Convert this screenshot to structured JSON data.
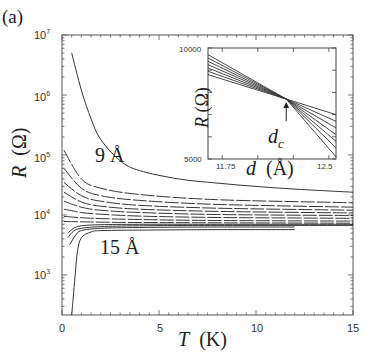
{
  "chart_data": {
    "type": "line",
    "panel_label": "(a)",
    "main": {
      "xlabel_var": "T",
      "xlabel_unit": "(K)",
      "ylabel_var": "R",
      "ylabel_unit": "(Ω)",
      "xlim": [
        0,
        15
      ],
      "ylim_log10": [
        2.3,
        7
      ],
      "yscale": "log",
      "x_ticks": [
        "0",
        "5",
        "10",
        "15"
      ],
      "y_ticks": [
        {
          "base": "10",
          "exp": "7"
        },
        {
          "base": "10",
          "exp": "6"
        },
        {
          "base": "10",
          "exp": "5"
        },
        {
          "base": "10",
          "exp": "4"
        },
        {
          "base": "10",
          "exp": "3"
        }
      ],
      "annotations": [
        {
          "text": "9 Å",
          "x": 2.2,
          "y": 100000
        },
        {
          "text": "15 Å",
          "x": 2.0,
          "y": 3000
        }
      ],
      "series_description": "Family of R(T) curves for film thicknesses from 9 Å (top, insulating) to 15 Å (bottom, superconducting)",
      "series": [
        {
          "name": "9 Å",
          "x": [
            0.5,
            1,
            1.5,
            2,
            3,
            4,
            6,
            8,
            10,
            12,
            15
          ],
          "y": [
            5000000,
            1200000,
            400000,
            180000,
            80000,
            55000,
            40000,
            34000,
            30000,
            27000,
            24000
          ]
        },
        {
          "name": "curve 2",
          "x": [
            0.1,
            1,
            2,
            4,
            8,
            15
          ],
          "y": [
            120000,
            40000,
            28000,
            22000,
            18000,
            16000
          ]
        },
        {
          "name": "curve 3",
          "x": [
            0.1,
            1,
            2,
            4,
            8,
            15
          ],
          "y": [
            60000,
            28000,
            21000,
            17500,
            15000,
            13500
          ]
        },
        {
          "name": "curve 4",
          "x": [
            0.1,
            1,
            2,
            4,
            8,
            15
          ],
          "y": [
            35000,
            21000,
            17000,
            14500,
            13000,
            12000
          ]
        },
        {
          "name": "curve 5",
          "x": [
            0.1,
            1,
            2,
            4,
            8,
            15
          ],
          "y": [
            24000,
            16500,
            14000,
            12500,
            11500,
            10800
          ]
        },
        {
          "name": "curve 6",
          "x": [
            0.1,
            1,
            2,
            4,
            8,
            15
          ],
          "y": [
            17000,
            13500,
            12000,
            11000,
            10200,
            9800
          ]
        },
        {
          "name": "curve 7",
          "x": [
            0.1,
            1,
            2,
            4,
            8,
            15
          ],
          "y": [
            12500,
            11000,
            10300,
            9600,
            9100,
            8800
          ]
        },
        {
          "name": "curve 8",
          "x": [
            0.1,
            1,
            2,
            4,
            8,
            15
          ],
          "y": [
            9500,
            9000,
            8700,
            8400,
            8100,
            7900
          ]
        },
        {
          "name": "curve 9",
          "x": [
            0.1,
            1,
            2,
            4,
            8,
            15
          ],
          "y": [
            7800,
            7700,
            7600,
            7500,
            7400,
            7300
          ]
        },
        {
          "name": "curve 10",
          "x": [
            0.3,
            0.6,
            1,
            2,
            4,
            8,
            15
          ],
          "y": [
            5000,
            6000,
            6600,
            6900,
            7000,
            7000,
            7000
          ]
        },
        {
          "name": "curve 11",
          "x": [
            0.3,
            0.6,
            1,
            2,
            4,
            8,
            15
          ],
          "y": [
            4200,
            5400,
            6000,
            6400,
            6600,
            6700,
            6700
          ]
        },
        {
          "name": "curve 12",
          "x": [
            0.4,
            0.7,
            1,
            2,
            4,
            8,
            12
          ],
          "y": [
            3200,
            4600,
            5500,
            6000,
            6200,
            6300,
            6300
          ]
        },
        {
          "name": "15 Å",
          "x": [
            0.5,
            0.6,
            0.7,
            0.8,
            1.0,
            1.5,
            2,
            4,
            8,
            12
          ],
          "y": [
            200,
            500,
            1200,
            2500,
            4200,
            5200,
            5500,
            5600,
            5700,
            5700
          ]
        }
      ]
    },
    "inset": {
      "xlabel_var": "d",
      "xlabel_unit": "(Å)",
      "ylabel_var": "R",
      "ylabel_unit": "(Ω)",
      "xlim": [
        11.65,
        12.55
      ],
      "ylim": [
        5000,
        10000
      ],
      "x_ticks": [
        "11.75",
        "12.5"
      ],
      "y_ticks": [
        "10000",
        "5000"
      ],
      "annotation": {
        "text": "d",
        "subscript": "c",
        "arrow_to": [
          12.2,
          7700
        ]
      },
      "crossing_point": {
        "d": 12.2,
        "R": 7700
      },
      "series_description": "Isotherms R(d) at various temperatures crossing at d_c",
      "series": [
        {
          "name": "isotherm 1",
          "x": [
            11.65,
            12.2,
            12.55
          ],
          "y": [
            9700,
            7700,
            7000
          ]
        },
        {
          "name": "isotherm 2",
          "x": [
            11.65,
            12.2,
            12.55
          ],
          "y": [
            9550,
            7700,
            6700
          ]
        },
        {
          "name": "isotherm 3",
          "x": [
            11.65,
            12.2,
            12.55
          ],
          "y": [
            9400,
            7700,
            6400
          ]
        },
        {
          "name": "isotherm 4",
          "x": [
            11.65,
            12.2,
            12.55
          ],
          "y": [
            9250,
            7700,
            6100
          ]
        },
        {
          "name": "isotherm 5",
          "x": [
            11.65,
            12.2,
            12.55
          ],
          "y": [
            9100,
            7700,
            5800
          ]
        },
        {
          "name": "isotherm 6",
          "x": [
            11.65,
            12.2,
            12.55
          ],
          "y": [
            8950,
            7700,
            5500
          ]
        },
        {
          "name": "isotherm 7",
          "x": [
            11.65,
            12.2,
            12.55
          ],
          "y": [
            8800,
            7700,
            5100
          ]
        }
      ]
    }
  },
  "labels": {
    "panel": "(a)",
    "y_var": "R",
    "y_unit": "(Ω)",
    "x_var": "T",
    "x_unit": "(K)",
    "anno_top": "9 Å",
    "anno_bottom": "15 Å",
    "inset_y_var": "R",
    "inset_y_unit": "(Ω)",
    "inset_x_var": "d",
    "inset_x_unit": "(Å)",
    "inset_dc_main": "d",
    "inset_dc_sub": "c",
    "xt0": "0",
    "xt1": "5",
    "xt2": "10",
    "xt3": "15",
    "yt_base": "10",
    "yt7": "7",
    "yt6": "6",
    "yt5": "5",
    "yt4": "4",
    "yt3": "3",
    "inset_yt_top": "10000",
    "inset_yt_bottom": "5000",
    "inset_xt_left": "11.75",
    "inset_xt_right": "12.5"
  }
}
